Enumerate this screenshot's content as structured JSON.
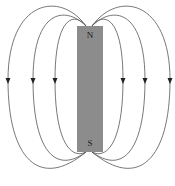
{
  "diagram": {
    "magnet": {
      "north_label": "N",
      "south_label": "S",
      "color": "#8c8c8c"
    },
    "field_lines": {
      "count_per_side": 3,
      "arrow_direction": "down",
      "color": "#555555"
    }
  }
}
